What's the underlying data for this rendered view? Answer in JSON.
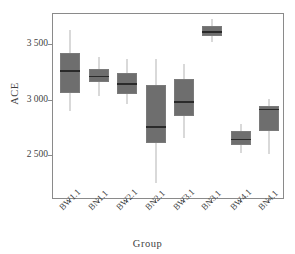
{
  "chart_data": {
    "type": "box",
    "title": "",
    "xlabel": "Group",
    "ylabel": "ACE",
    "categories": [
      "BW1.1",
      "BN1.1",
      "BW2.1",
      "BN2.1",
      "BW3.1",
      "BN3.1",
      "BW4.1",
      "BN4.1"
    ],
    "ytick_labels": [
      "2 500",
      "3 000",
      "3 500"
    ],
    "ytick_values": [
      2500,
      3000,
      3500
    ],
    "ylim": [
      2200,
      3780
    ],
    "grid": false,
    "legend": null,
    "box_color": "#6e6e6e",
    "median_color": "#2a2a2a",
    "whisker_color": "#b4b4b4",
    "frame_color": "#8a8a8a",
    "boxes": [
      {
        "label": "BW1.1",
        "whisker_low": 2905,
        "q1": 3070,
        "median": 3272,
        "q3": 3430,
        "whisker_high": 3632
      },
      {
        "label": "BN1.1",
        "whisker_low": 3038,
        "q1": 3165,
        "median": 3224,
        "q3": 3284,
        "whisker_high": 3392
      },
      {
        "label": "BW2.1",
        "whisker_low": 2966,
        "q1": 3056,
        "median": 3155,
        "q3": 3251,
        "whisker_high": 3377
      },
      {
        "label": "BN2.1",
        "whisker_low": 2260,
        "q1": 2620,
        "median": 2770,
        "q3": 3137,
        "whisker_high": 3372
      },
      {
        "label": "BW3.1",
        "whisker_low": 2665,
        "q1": 2860,
        "median": 2995,
        "q3": 3191,
        "whisker_high": 3328
      },
      {
        "label": "BN3.1",
        "whisker_low": 3531,
        "q1": 3585,
        "median": 3624,
        "q3": 3669,
        "whisker_high": 3732
      },
      {
        "label": "BW4.1",
        "whisker_low": 2530,
        "q1": 2599,
        "median": 2655,
        "q3": 2725,
        "whisker_high": 2786
      },
      {
        "label": "BN4.1",
        "whisker_low": 2516,
        "q1": 2725,
        "median": 2926,
        "q3": 2950,
        "whisker_high": 3016
      }
    ]
  }
}
